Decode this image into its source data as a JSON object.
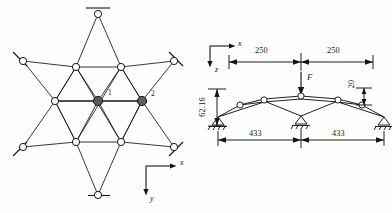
{
  "figure": {
    "type": "engineering-structural-diagram",
    "ink_color": "#141414",
    "background": "#ffffff",
    "node_fill_open": "#ffffff",
    "node_fill_solid": "#5c5c5c"
  },
  "left_panel": {
    "name": "plan-view-star-grid",
    "node_labels": [
      "1",
      "2"
    ],
    "axes": {
      "x_label": "x",
      "y_label": "y"
    },
    "support_count": 6,
    "highlighted_node_count": 2
  },
  "right_panel": {
    "name": "elevation-arch-truss",
    "axes": {
      "x_label": "x",
      "z_label": "z"
    },
    "load": {
      "label": "F",
      "direction": "down"
    },
    "top_dimensions": [
      "250",
      "250"
    ],
    "bottom_dimensions": [
      "433",
      "433"
    ],
    "height_dimension": "62.16",
    "rise_dimension": "20",
    "support_count": 3
  }
}
